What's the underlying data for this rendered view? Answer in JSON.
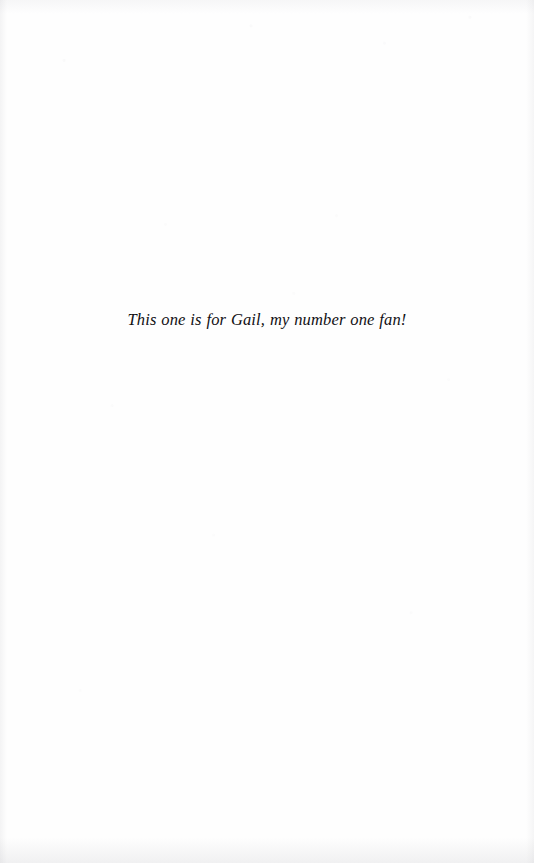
{
  "page": {
    "kind": "book-dedication-page",
    "background_color": "#fefefe",
    "text_color": "#111014"
  },
  "dedication": {
    "text": "This one is for Gail, my number one fan!"
  }
}
